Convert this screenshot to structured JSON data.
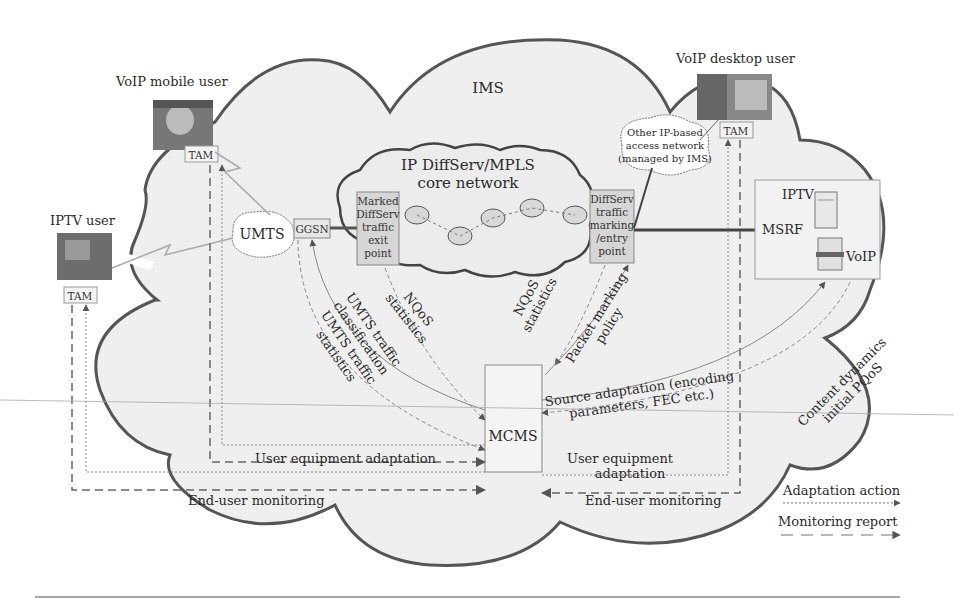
{
  "domain": {
    "ims_label": "IMS",
    "core_network": {
      "line1": "IP DiffServ/MPLS",
      "line2": "core network"
    },
    "other_access_network": {
      "line1": "Other IP-based",
      "line2": "access network",
      "line3": "(managed by IMS)"
    },
    "umts": "UMTS",
    "ggsn": "GGSN",
    "exit_point": {
      "lines": [
        "Marked",
        "DiffServ",
        "traffic",
        "exit",
        "point"
      ]
    },
    "entry_point": {
      "lines": [
        "DiffServ",
        "traffic",
        "marking",
        "/entry",
        "point"
      ]
    },
    "mcms": "MCMS",
    "msrf": {
      "label": "MSRF",
      "iptv": "IPTV",
      "voip": "VoIP"
    }
  },
  "users": {
    "voip_mobile": {
      "label": "VoIP mobile user",
      "tam": "TAM"
    },
    "iptv": {
      "label": "IPTV user",
      "tam": "TAM"
    },
    "voip_desktop": {
      "label": "VoIP desktop user",
      "tam": "TAM"
    }
  },
  "flows": {
    "nqos_left": {
      "line1": "NQoS",
      "line2": "statistics"
    },
    "nqos_right": {
      "line1": "NQoS",
      "line2": "statistics"
    },
    "packet_marking": {
      "line1": "Packet marking",
      "line2": "policy"
    },
    "umts_classification": {
      "line1": "UMTS traffic",
      "line2": "classification"
    },
    "umts_statistics": {
      "line1": "UMTS traffic",
      "line2": "statistics"
    },
    "source_adaptation": {
      "line1": "Source adaptation (encoding",
      "line2": "parameters, FEC etc.)"
    },
    "content_dynamics": {
      "line1": "Content dynamics",
      "line2": "initial PQoS"
    },
    "ue_adaptation_left": "User equipment adaptation",
    "ue_adaptation_right": {
      "line1": "User equipment",
      "line2": "adaptation"
    },
    "eu_monitoring_left": "End-user monitoring",
    "eu_monitoring_right": "End-user monitoring"
  },
  "legend": {
    "adaptation_action": "Adaptation action",
    "monitoring_report": "Monitoring report"
  },
  "colors": {
    "cloud_fill": "#eeeeee",
    "cloud_stroke": "#555555",
    "box_fill": "#dcdcdc",
    "line": "#666666"
  }
}
